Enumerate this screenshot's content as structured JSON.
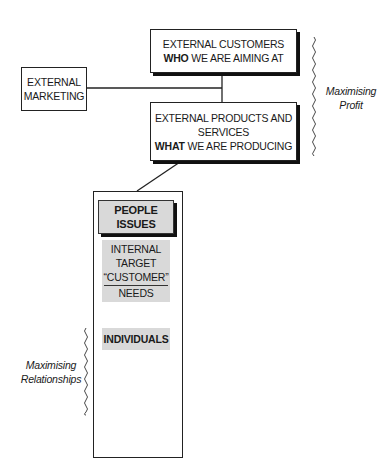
{
  "diagram": {
    "nodes": {
      "external_customers": {
        "line1": "EXTERNAL CUSTOMERS",
        "line2_bold": "WHO",
        "line2_rest": " WE ARE AIMING AT"
      },
      "external_marketing": {
        "line1": "EXTERNAL",
        "line2": "MARKETING"
      },
      "external_products": {
        "line1": "EXTERNAL PRODUCTS AND",
        "line2": "SERVICES",
        "line3_bold": "WHAT",
        "line3_rest": " WE ARE PRODUCING"
      },
      "people_issues": {
        "line1": "PEOPLE",
        "line2": "ISSUES"
      },
      "internal_target": {
        "line1": "INTERNAL",
        "line2": "TARGET",
        "line3": "“CUSTOMER”",
        "line4": "NEEDS"
      },
      "individuals": {
        "label": "INDIVIDUALS"
      }
    },
    "annotations": {
      "profit": {
        "line1": "Maximising",
        "line2": "Profit"
      },
      "relationships": {
        "line1": "Maximising",
        "line2": "Relationships"
      }
    },
    "colors": {
      "line": "#222222",
      "shade": "#d9d9d9",
      "background": "#ffffff"
    }
  }
}
